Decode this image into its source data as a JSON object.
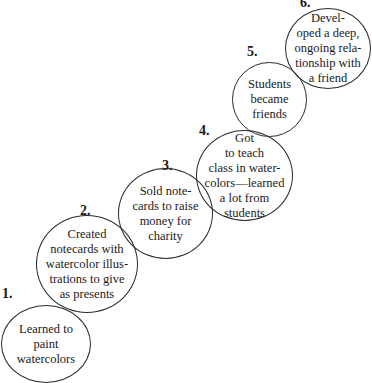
{
  "steps": [
    {
      "number": "1.",
      "text": "Learned to\npaint\nwatercolors"
    },
    {
      "number": "2.",
      "text": "Created\nnotecards with\nwatercolor illus-\ntrations to give\nas presents"
    },
    {
      "number": "3.",
      "text": "Sold note-\ncards to raise\nmoney for\ncharity"
    },
    {
      "number": "4.",
      "text": "Got\nto teach\nclass in water-\ncolors—learned\na lot from\nstudents"
    },
    {
      "number": "5.",
      "text": "Students\nbecame\nfriends"
    },
    {
      "number": "6.",
      "text": "Devel-\noped a deep,\nongoing rela-\ntionship with\na friend"
    }
  ]
}
